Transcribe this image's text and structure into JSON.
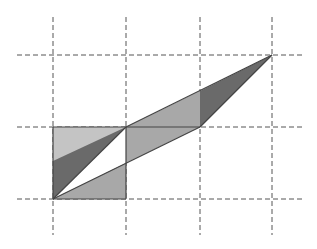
{
  "diagram": {
    "title": "",
    "grid": {
      "x_lines": [
        53,
        126,
        200,
        272
      ],
      "y_lines": [
        55,
        127,
        199
      ],
      "h_extent": [
        17,
        305
      ],
      "v_extent": [
        17,
        235
      ],
      "stroke": "#555555",
      "dash": "5,3"
    },
    "colors": {
      "light": "#c4c4c4",
      "mid": "#a8a8a8",
      "dark": "#6a6a6a",
      "white": "#ffffff",
      "edge": "#444444"
    },
    "shapes": [
      {
        "name": "light-square",
        "fill": "light",
        "points": "53,127 126,127 126,199 53,199"
      },
      {
        "name": "dark-left-triangle",
        "fill": "dark",
        "points": "53,199 126,127 53,161"
      },
      {
        "name": "white-sliver-triangle",
        "fill": "white",
        "points": "53,199 126,127 126,163"
      },
      {
        "name": "mid-lower-triangle",
        "fill": "mid",
        "points": "53,199 126,163 126,199"
      },
      {
        "name": "mid-parallelogram",
        "fill": "mid",
        "points": "126,127 200,91 200,127 126,163"
      },
      {
        "name": "dark-right-triangle",
        "fill": "dark",
        "points": "200,91 272,55 200,127"
      }
    ],
    "edges": [
      {
        "name": "edge-upper-diagonal",
        "x1": 126,
        "y1": 127,
        "x2": 272,
        "y2": 55
      },
      {
        "name": "edge-lower-diagonal",
        "x1": 53,
        "y1": 199,
        "x2": 200,
        "y2": 127
      },
      {
        "name": "edge-right-diagonal",
        "x1": 200,
        "y1": 127,
        "x2": 272,
        "y2": 55
      },
      {
        "name": "edge-left-diagonal",
        "x1": 53,
        "y1": 199,
        "x2": 126,
        "y2": 127
      },
      {
        "name": "edge-square-top",
        "x1": 53,
        "y1": 127,
        "x2": 200,
        "y2": 127
      },
      {
        "name": "edge-square-bottom",
        "x1": 53,
        "y1": 199,
        "x2": 126,
        "y2": 199
      },
      {
        "name": "edge-square-left",
        "x1": 53,
        "y1": 127,
        "x2": 53,
        "y2": 199
      },
      {
        "name": "edge-square-right",
        "x1": 126,
        "y1": 127,
        "x2": 126,
        "y2": 199
      }
    ]
  }
}
